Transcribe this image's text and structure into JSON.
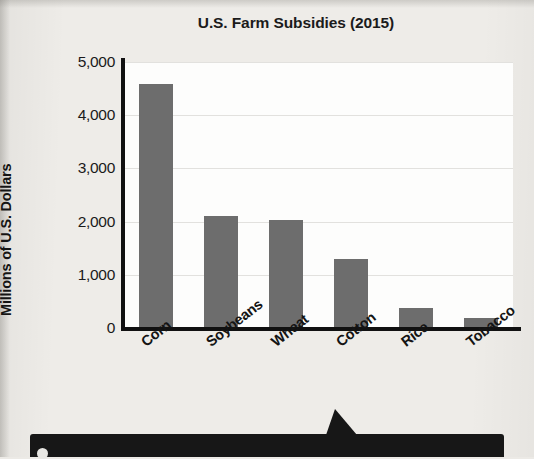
{
  "chart_data": {
    "type": "bar",
    "title": "U.S. Farm Subsidies (2015)",
    "xlabel": "",
    "ylabel": "Millions of U.S. Dollars",
    "categories": [
      "Corn",
      "Soybeans",
      "Wheat",
      "Cotton",
      "Rice",
      "Tobacco"
    ],
    "values": [
      4580,
      2110,
      2030,
      1300,
      370,
      190
    ],
    "ylim": [
      0,
      5000
    ],
    "ytick_labels": [
      "0",
      "1,000",
      "2,000",
      "3,000",
      "4,000",
      "5,000"
    ],
    "ytick_values": [
      0,
      1000,
      2000,
      3000,
      4000,
      5000
    ],
    "grid": true,
    "legend": "none",
    "bar_color": "#6d6d6d",
    "axis_color": "#111111",
    "plot_background": "#fdfdfc",
    "page_background": "#eeece8"
  },
  "banner": {
    "bullet_icon": "circle-bullet-icon"
  },
  "icons": {
    "pointer": "arrow-pointer-icon"
  }
}
